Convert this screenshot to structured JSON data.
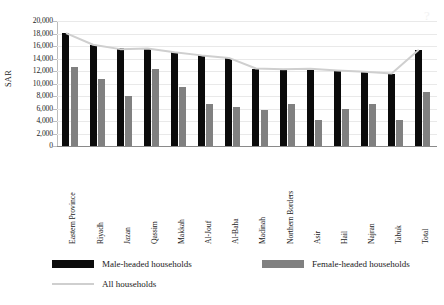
{
  "chart_data": {
    "type": "bar",
    "title": "",
    "subtitle": "",
    "xlabel": "",
    "ylabel": "SAR",
    "ylim": [
      0,
      20000
    ],
    "ytick_step": 2000,
    "yticks": [
      "0",
      "2,000",
      "4,000",
      "6,000",
      "8,000",
      "10,000",
      "12,000",
      "14,000",
      "16,000",
      "18,000",
      "20,000"
    ],
    "grid": true,
    "legend_position": "bottom",
    "categories": [
      "Eastern Province",
      "Riyadh",
      "Jazan",
      "Qassim",
      "Makkah",
      "Al-Jouf",
      "Al-Baha",
      "Madinah",
      "Northern Borders",
      "Asir",
      "Hail",
      "Najran",
      "Tabuk",
      "Total"
    ],
    "series": [
      {
        "name": "Male-headed households",
        "kind": "bar",
        "color": "#0b0b0b",
        "values": [
          18050,
          16200,
          15700,
          15650,
          15000,
          14500,
          14100,
          12300,
          12200,
          12300,
          12000,
          11800,
          11500,
          15400
        ]
      },
      {
        "name": "Female-headed households",
        "kind": "bar",
        "color": "#808080",
        "values": [
          12700,
          10700,
          8050,
          12300,
          9400,
          6800,
          6200,
          5800,
          6800,
          4200,
          5900,
          6700,
          4200,
          8700
        ]
      },
      {
        "name": "All households",
        "kind": "line",
        "color": "#cfcfcf",
        "values": [
          18050,
          16200,
          15500,
          15600,
          15000,
          14500,
          14100,
          12400,
          12300,
          12350,
          12100,
          11900,
          11600,
          15400
        ]
      }
    ]
  },
  "legend": {
    "items": [
      {
        "label": "Male-headed households",
        "swatch": "black-square",
        "color": "#0b0b0b"
      },
      {
        "label": "Female-headed households",
        "swatch": "gray-square",
        "color": "#808080"
      },
      {
        "label": "All households",
        "swatch": "gray-line",
        "color": "#cfcfcf"
      }
    ]
  },
  "axis": {
    "y_title": "SAR"
  },
  "artifact": {
    "glyph": "?"
  }
}
